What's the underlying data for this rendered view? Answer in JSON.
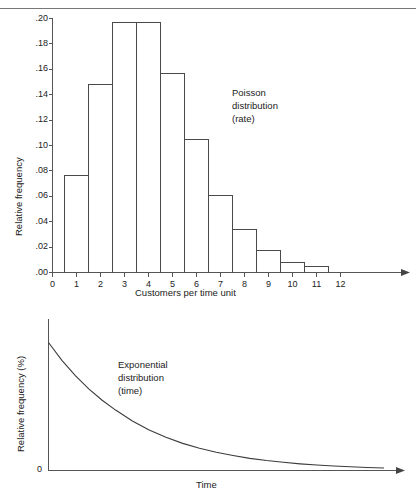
{
  "page": {
    "top_rule": true
  },
  "chart_data": [
    {
      "id": "poisson",
      "type": "bar",
      "title": "",
      "annotation": "Poisson\ndistribution\n(rate)",
      "annotation_lines": [
        "Poisson",
        "distribution",
        "(rate)"
      ],
      "xlabel": "Customers per time unit",
      "ylabel": "Relative frequency",
      "categories": [
        0,
        1,
        2,
        3,
        4,
        5,
        6,
        7,
        8,
        9,
        10,
        11
      ],
      "xtick_labels": [
        "0",
        "1",
        "2",
        "3",
        "4",
        "5",
        "6",
        "7",
        "8",
        "9",
        "10",
        "11",
        "12"
      ],
      "values": [
        0.076,
        0.148,
        0.197,
        0.197,
        0.157,
        0.105,
        0.061,
        0.034,
        0.017,
        0.008,
        0.005
      ],
      "bar_left_edges": [
        0.5,
        1.5,
        2.5,
        3.5,
        4.5,
        5.5,
        6.5,
        7.5,
        8.5,
        9.5,
        10.5
      ],
      "ytick_labels": [
        ".20",
        ".18",
        ".16",
        ".14",
        ".12",
        ".10",
        ".08",
        ".06",
        ".04",
        ".02",
        ".00"
      ],
      "ytick_values": [
        0.2,
        0.18,
        0.16,
        0.14,
        0.12,
        0.1,
        0.08,
        0.06,
        0.04,
        0.02,
        0.0
      ],
      "ylim": [
        0.0,
        0.2
      ],
      "xlim": [
        0,
        12
      ],
      "grid": false,
      "legend": "none",
      "x_axis_arrow": true
    },
    {
      "id": "exponential",
      "type": "line",
      "title": "",
      "annotation": "Exponential\ndistribution\n(time)",
      "annotation_lines": [
        "Exponential",
        "distribution",
        "(time)"
      ],
      "xlabel": "Time",
      "ylabel": "Relative frequency (%)",
      "ytick_labels": [
        "0"
      ],
      "ytick_values": [
        0
      ],
      "xtick_labels": [],
      "ylim": [
        0,
        1
      ],
      "xlim": [
        0,
        1
      ],
      "grid": false,
      "legend": "none",
      "x_axis_arrow": true,
      "curve_description": "exponential decay from peak at x=0 to near zero",
      "x": [
        0.0,
        0.04,
        0.08,
        0.12,
        0.16,
        0.2,
        0.25,
        0.3,
        0.35,
        0.4,
        0.45,
        0.5,
        0.55,
        0.6,
        0.65,
        0.7,
        0.75,
        0.8,
        0.85,
        0.9,
        0.95,
        1.0
      ],
      "y": [
        1.0,
        0.861,
        0.741,
        0.638,
        0.549,
        0.472,
        0.387,
        0.317,
        0.259,
        0.212,
        0.174,
        0.142,
        0.117,
        0.095,
        0.078,
        0.064,
        0.052,
        0.043,
        0.035,
        0.029,
        0.024,
        0.02
      ]
    }
  ],
  "colors": {
    "stroke": "#4a4a4a",
    "axis": "#555555",
    "text": "#222222",
    "rule": "#777777",
    "background": "#ffffff"
  }
}
